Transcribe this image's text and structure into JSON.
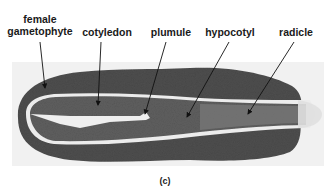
{
  "figure": {
    "caption": "(c)",
    "labels": [
      {
        "id": "female-gametophyte",
        "text_line1": "female",
        "text_line2": "gametophyte"
      },
      {
        "id": "cotyledon",
        "text": "cotyledon"
      },
      {
        "id": "plumule",
        "text": "plumule"
      },
      {
        "id": "hypocotyl",
        "text": "hypocotyl"
      },
      {
        "id": "radicle",
        "text": "radicle"
      }
    ],
    "colors": {
      "background": "#ffffff",
      "tissue_outer": "#5a5a5a",
      "tissue_inner": "#6e6e6e",
      "gap": "#eeeeee",
      "text": "#1a1a1a"
    }
  }
}
